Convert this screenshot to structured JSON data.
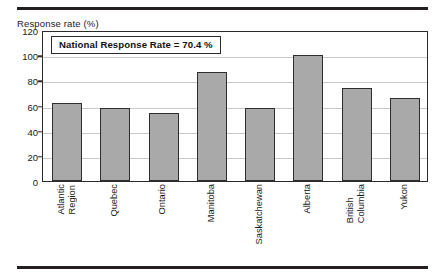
{
  "figure": {
    "axis_title": "Response rate (%)",
    "annotation": "National Response Rate = 70.4 %"
  },
  "chart_data": {
    "type": "bar",
    "title": "",
    "xlabel": "",
    "ylabel": "Response rate (%)",
    "ylim": [
      0,
      120
    ],
    "ytick_step": 20,
    "grid": true,
    "legend": "none",
    "annotations": [
      "National Response Rate = 70.4 %"
    ],
    "national_response_rate": 70.4,
    "categories": [
      "Atlantic Region",
      "Quebec",
      "Ontario",
      "Manitoba",
      "Saskatchewan",
      "Alberta",
      "British Columbia",
      "Yukon"
    ],
    "category_lines": [
      [
        "Atlantic",
        "Region"
      ],
      [
        "Quebec"
      ],
      [
        "Ontario"
      ],
      [
        "Manitoba"
      ],
      [
        "Saskatchewan"
      ],
      [
        "Alberta"
      ],
      [
        "British",
        "Columbia"
      ],
      [
        "Yukon"
      ]
    ],
    "values": [
      62,
      58,
      54,
      87,
      58,
      100,
      74,
      66
    ],
    "yticks": [
      0,
      20,
      40,
      60,
      80,
      100,
      120
    ],
    "ytick_labels": [
      "0",
      "20",
      "40",
      "60",
      "80",
      "100",
      "120"
    ],
    "colors": {
      "bar_fill": "#a9a9a9",
      "bar_edge": "#2e2e2e",
      "gridline": "#c9c9c9",
      "frame": "#2b2b2b",
      "rule": "#231f20",
      "text": "#1a1a1a"
    }
  }
}
